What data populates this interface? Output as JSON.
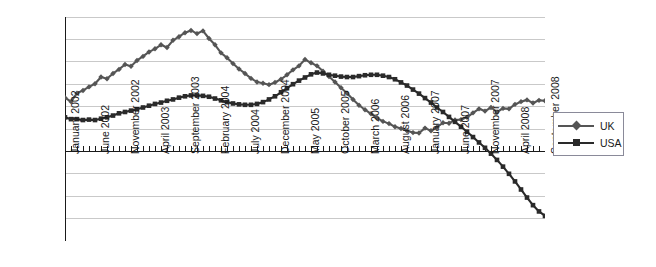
{
  "chart_data": {
    "type": "line",
    "title": "",
    "xlabel": "",
    "ylabel": "",
    "ylim": [
      -20,
      30
    ],
    "ytick_step": 5,
    "grid": true,
    "legend_position": "right",
    "y_ticklabels": [
      "30.0%",
      "25.0%",
      "20.0%",
      "15.0%",
      "10.0%",
      "5.0%",
      "0.0%",
      "-5.0%",
      "-10.0%",
      "-15.0%",
      "-20.0%"
    ],
    "x_ticklabels": [
      "January 2002",
      "June 2002",
      "November 2002",
      "April 2003",
      "September 2003",
      "February 2004",
      "July 2004",
      "December 2004",
      "May 2005",
      "October 2005",
      "March 2006",
      "August 2006",
      "January 2007",
      "June 2007",
      "November 2007",
      "April 2008",
      "September 2008"
    ],
    "x_ticklabel_interval_months": 5,
    "x_range": [
      "January 2002",
      "September 2008"
    ],
    "n_points": 81,
    "series": [
      {
        "name": "UK",
        "color": "#555555",
        "marker": "diamond",
        "values": [
          12.0,
          11.1,
          13.0,
          13.6,
          14.4,
          15.1,
          16.6,
          16.2,
          17.4,
          18.3,
          19.4,
          19.0,
          20.3,
          21.2,
          22.2,
          22.9,
          23.8,
          23.2,
          24.8,
          25.6,
          26.5,
          27.0,
          26.3,
          26.9,
          25.2,
          23.8,
          22.0,
          20.9,
          19.6,
          18.4,
          17.4,
          16.3,
          15.5,
          15.2,
          14.9,
          15.4,
          16.1,
          17.1,
          18.2,
          19.1,
          20.5,
          19.8,
          19.1,
          17.9,
          16.7,
          15.5,
          14.2,
          13.0,
          11.6,
          10.3,
          9.3,
          8.4,
          7.5,
          6.7,
          6.2,
          5.5,
          5.1,
          4.6,
          4.2,
          4.1,
          5.2,
          4.6,
          5.4,
          6.4,
          6.3,
          7.0,
          7.1,
          7.6,
          8.6,
          9.5,
          9.0,
          9.8,
          8.8,
          9.6,
          9.5,
          10.5,
          11.1,
          11.5,
          10.8,
          11.4,
          11.3
        ]
      },
      {
        "name": "USA",
        "color": "#2a2a2a",
        "marker": "square",
        "values": [
          7.6,
          7.2,
          7.2,
          7.0,
          7.1,
          7.0,
          7.3,
          7.6,
          8.0,
          8.5,
          8.8,
          9.1,
          9.4,
          9.8,
          10.2,
          10.6,
          10.9,
          11.3,
          11.6,
          12.0,
          12.3,
          12.5,
          12.5,
          12.4,
          12.2,
          11.8,
          11.4,
          11.0,
          10.7,
          10.5,
          10.4,
          10.4,
          10.6,
          11.0,
          11.6,
          12.3,
          13.2,
          14.1,
          15.0,
          15.8,
          16.5,
          17.2,
          17.6,
          17.4,
          17.1,
          16.9,
          16.7,
          16.6,
          16.6,
          16.8,
          17.0,
          17.1,
          17.1,
          16.9,
          16.6,
          16.1,
          15.4,
          14.7,
          13.8,
          12.9,
          11.9,
          10.9,
          9.8,
          8.8,
          7.7,
          6.6,
          5.5,
          4.4,
          3.2,
          2.0,
          0.8,
          -0.5,
          -1.9,
          -3.4,
          -5.0,
          -6.7,
          -8.5,
          -10.3,
          -12.0,
          -13.4,
          -14.4
        ]
      }
    ]
  },
  "legend": {
    "items": [
      {
        "label": "UK"
      },
      {
        "label": "USA"
      }
    ]
  }
}
